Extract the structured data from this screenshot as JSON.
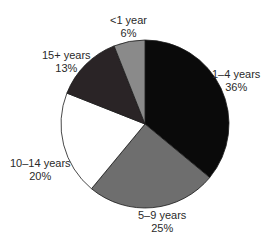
{
  "chart_data": {
    "type": "pie",
    "title": "",
    "start_angle": "12 o'clock",
    "direction": "clockwise",
    "categories": [
      "1–4 years",
      "5–9 years",
      "10–14 years",
      "15+ years",
      "<1 year"
    ],
    "values": [
      36,
      25,
      20,
      13,
      6
    ],
    "value_labels": [
      "36%",
      "25%",
      "20%",
      "13%",
      "6%"
    ],
    "colors": [
      "#0a0a0a",
      "#6e6e6e",
      "#ffffff",
      "#2a2426",
      "#8a8a8a"
    ],
    "legend": "none (direct labels)"
  },
  "labels": [
    {
      "name": "1–4 years",
      "pct": "36%"
    },
    {
      "name": "5–9 years",
      "pct": "25%"
    },
    {
      "name": "10–14 years",
      "pct": "20%"
    },
    {
      "name": "15+ years",
      "pct": "13%"
    },
    {
      "name": "<1 year",
      "pct": "6%"
    }
  ]
}
